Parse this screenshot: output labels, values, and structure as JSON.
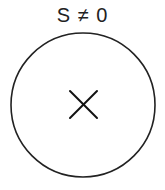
{
  "diagram": {
    "label": "S ≠ 0",
    "circle": {
      "cx": 83,
      "cy": 105,
      "r": 72,
      "stroke": "#222222",
      "stroke_width": 1.6
    },
    "center_marker": {
      "symbol": "cross",
      "x1": 70,
      "y1": 91,
      "x2": 97,
      "y2": 118,
      "stroke": "#111111",
      "stroke_width": 2
    }
  }
}
